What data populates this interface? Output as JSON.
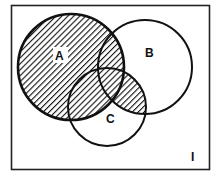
{
  "diagram": {
    "type": "venn",
    "universe_label": "I",
    "sets": [
      {
        "label": "A",
        "cx": 71,
        "cy": 67,
        "r": 53
      },
      {
        "label": "B",
        "cx": 145,
        "cy": 67,
        "r": 47
      },
      {
        "label": "C",
        "cx": 107,
        "cy": 107,
        "r": 39
      }
    ],
    "shaded_region": "A ∪ (B ∩ C)",
    "shading": "diagonal-hatch",
    "colors": {
      "ink": "#111111",
      "background": "#ffffff"
    }
  }
}
